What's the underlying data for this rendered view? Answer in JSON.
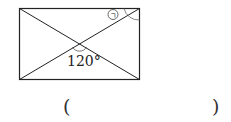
{
  "figure": {
    "shape": "rectangle with both diagonals",
    "angle_label": "120°",
    "marked_angle_symbol": "ㄱ",
    "stroke_color": "#222222"
  },
  "answer": {
    "open_paren": "(",
    "close_paren": ")",
    "blank": ""
  }
}
